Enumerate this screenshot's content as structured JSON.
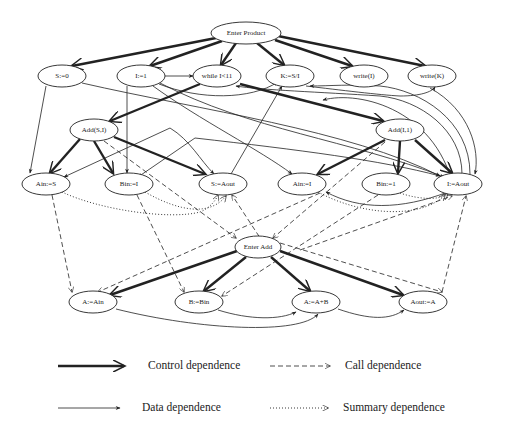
{
  "diagram": {
    "nodes": [
      {
        "id": "enter_product",
        "label": "Enter Product",
        "x": 246,
        "y": 33,
        "rx": 35,
        "ry": 11
      },
      {
        "id": "s0",
        "label": "S:=0",
        "x": 62,
        "y": 76,
        "rx": 24,
        "ry": 11
      },
      {
        "id": "i1",
        "label": "I:=1",
        "x": 141,
        "y": 76,
        "rx": 24,
        "ry": 11
      },
      {
        "id": "while",
        "label": "while I<11",
        "x": 217,
        "y": 76,
        "rx": 24,
        "ry": 11
      },
      {
        "id": "k",
        "label": "K:=S/I",
        "x": 290,
        "y": 76,
        "rx": 24,
        "ry": 11
      },
      {
        "id": "writei",
        "label": "write(I)",
        "x": 364,
        "y": 76,
        "rx": 24,
        "ry": 11
      },
      {
        "id": "writek",
        "label": "write(K)",
        "x": 432,
        "y": 76,
        "rx": 24,
        "ry": 11
      },
      {
        "id": "addsi",
        "label": "Add(S,I)",
        "x": 94,
        "y": 130,
        "rx": 24,
        "ry": 11
      },
      {
        "id": "addi1",
        "label": "Add(I,1)",
        "x": 400,
        "y": 130,
        "rx": 24,
        "ry": 11
      },
      {
        "id": "ains",
        "label": "Ain:=S",
        "x": 46,
        "y": 184,
        "rx": 24,
        "ry": 11
      },
      {
        "id": "bini",
        "label": "Bin:=I",
        "x": 129,
        "y": 184,
        "rx": 24,
        "ry": 11
      },
      {
        "id": "saout",
        "label": "S:=Aout",
        "x": 223,
        "y": 184,
        "rx": 24,
        "ry": 11
      },
      {
        "id": "aini",
        "label": "Ain:=I",
        "x": 302,
        "y": 184,
        "rx": 24,
        "ry": 11
      },
      {
        "id": "bin1",
        "label": "Bin:=1",
        "x": 386,
        "y": 184,
        "rx": 24,
        "ry": 11
      },
      {
        "id": "iaout",
        "label": "I:=Aout",
        "x": 458,
        "y": 184,
        "rx": 24,
        "ry": 11
      },
      {
        "id": "enter_add",
        "label": "Enter Add",
        "x": 258,
        "y": 247,
        "rx": 23,
        "ry": 11
      },
      {
        "id": "aain",
        "label": "A:=Ain",
        "x": 93,
        "y": 302,
        "rx": 24,
        "ry": 11
      },
      {
        "id": "bbin",
        "label": "B:=Bin",
        "x": 199,
        "y": 302,
        "rx": 24,
        "ry": 11
      },
      {
        "id": "aab",
        "label": "A:=A+B",
        "x": 316,
        "y": 302,
        "rx": 24,
        "ry": 11
      },
      {
        "id": "aouta",
        "label": "Aout:=A",
        "x": 423,
        "y": 302,
        "rx": 24,
        "ry": 11
      }
    ],
    "edges": [
      {
        "type": "control",
        "d": "M216,38 L72,66"
      },
      {
        "type": "control",
        "d": "M222,41 L150,66"
      },
      {
        "type": "control",
        "d": "M236,43 L221,65"
      },
      {
        "type": "control",
        "d": "M257,43 L284,65"
      },
      {
        "type": "control",
        "d": "M275,40 L352,66"
      },
      {
        "type": "control",
        "d": "M278,36 L425,66"
      },
      {
        "type": "control",
        "d": "M200,84 L110,121"
      },
      {
        "type": "control",
        "d": "M240,84 L383,121"
      },
      {
        "type": "control",
        "d": "M80,139 L50,173"
      },
      {
        "type": "control",
        "d": "M94,141 L113,173"
      },
      {
        "type": "control",
        "d": "M114,137 L205,174"
      },
      {
        "type": "control",
        "d": "M385,140 L318,174"
      },
      {
        "type": "control",
        "d": "M400,141 L398,173"
      },
      {
        "type": "control",
        "d": "M415,140 L452,173"
      },
      {
        "type": "control",
        "d": "M237,251 L110,295"
      },
      {
        "type": "control",
        "d": "M246,257 L204,291"
      },
      {
        "type": "control",
        "d": "M271,257 L310,291"
      },
      {
        "type": "control",
        "d": "M280,251 L403,295"
      },
      {
        "type": "data",
        "d": "M165,76 L193,76"
      },
      {
        "type": "data",
        "d": "M46,86 L30,173"
      },
      {
        "type": "data",
        "d": "M127,86 L127,173"
      },
      {
        "type": "data",
        "d": "M82,83 C200,110 350,130 440,176"
      },
      {
        "type": "data",
        "d": "M153,86 C200,120 260,150 292,174"
      },
      {
        "type": "data",
        "d": "M159,84 C200,100 250,100 278,82"
      },
      {
        "type": "data",
        "d": "M160,83 C250,130 350,140 444,177"
      },
      {
        "type": "data",
        "d": "M231,174 L282,86"
      },
      {
        "type": "data",
        "d": "M170,128 L64,177"
      },
      {
        "type": "data",
        "d": "M170,128 C190,140 200,160 214,174"
      },
      {
        "type": "data",
        "d": "M195,138 L138,177"
      },
      {
        "type": "data",
        "d": "M195,138 C300,150 380,160 440,176"
      },
      {
        "type": "data",
        "d": "M306,86 C340,90 380,95 400,96 C420,96 432,92 435,87"
      },
      {
        "type": "data",
        "d": "M430,88 C470,110 480,150 475,174"
      },
      {
        "type": "data",
        "d": "M470,174 C470,120 420,90 380,86 C350,84 330,86 310,86"
      },
      {
        "type": "data",
        "d": "M462,174 C462,130 420,100 380,96 C320,92 260,90 236,86"
      },
      {
        "type": "data",
        "d": "M448,192 C400,210 360,210 326,192"
      },
      {
        "type": "data",
        "d": "M455,195 C440,110 360,90 323,100"
      },
      {
        "type": "data",
        "d": "M218,310 C250,320 280,320 296,312"
      },
      {
        "type": "data",
        "d": "M116,309 C200,330 300,335 318,314"
      },
      {
        "type": "data",
        "d": "M338,309 C370,320 390,320 404,310"
      },
      {
        "type": "call",
        "d": "M52,195 L72,292"
      },
      {
        "type": "call",
        "d": "M137,195 L184,292"
      },
      {
        "type": "call",
        "d": "M104,141 L236,238"
      },
      {
        "type": "call",
        "d": "M320,193 L98,292"
      },
      {
        "type": "call",
        "d": "M385,142 L273,238"
      },
      {
        "type": "call",
        "d": "M378,195 L222,296"
      },
      {
        "type": "call",
        "d": "M280,243 L442,292"
      },
      {
        "type": "call",
        "d": "M442,292 L466,196"
      },
      {
        "type": "call",
        "d": "M268,250 L232,195"
      },
      {
        "type": "call",
        "d": "M300,250 L452,196"
      },
      {
        "type": "summary",
        "d": "M62,192 C100,210 170,220 200,212 C210,208 216,200 218,195"
      },
      {
        "type": "summary",
        "d": "M145,192 C180,212 210,216 226,196"
      },
      {
        "type": "summary",
        "d": "M318,192 C360,215 420,220 445,195"
      },
      {
        "type": "summary",
        "d": "M400,193 C420,200 440,200 448,194"
      }
    ]
  },
  "legend": {
    "items": [
      {
        "type": "control",
        "label": "Control dependence"
      },
      {
        "type": "call",
        "label": "Call dependence"
      },
      {
        "type": "data",
        "label": "Data dependence"
      },
      {
        "type": "summary",
        "label": "Summary dependence"
      }
    ]
  }
}
